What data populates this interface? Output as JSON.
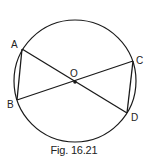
{
  "figure": {
    "caption": "Fig. 16.21",
    "stroke_color": "#1a1a1a",
    "circle": {
      "cx": 75,
      "cy": 81,
      "r": 61,
      "center_label": "O"
    },
    "points": {
      "A": {
        "label": "A",
        "x": 22,
        "y": 49
      },
      "B": {
        "label": "B",
        "x": 17,
        "y": 100
      },
      "C": {
        "label": "C",
        "x": 133,
        "y": 61
      },
      "D": {
        "label": "D",
        "x": 127,
        "y": 113
      },
      "O": {
        "label": "O",
        "x": 75,
        "y": 82
      }
    },
    "segments": [
      "AD",
      "BC",
      "AB",
      "CD"
    ]
  }
}
